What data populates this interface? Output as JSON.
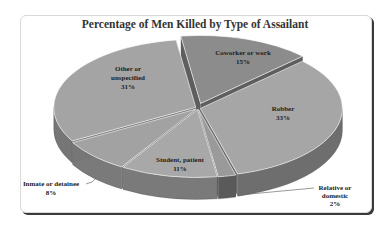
{
  "chart_data": {
    "type": "pie",
    "title": "Percentage of Men Killed by Type of Assailant",
    "style": "3d-exploded",
    "slices": [
      {
        "label": "Coworker or work",
        "value": 15,
        "display": "15%",
        "color": "#8c8c8c",
        "side": "#5e5e5e",
        "exploded": true
      },
      {
        "label": "Robber",
        "value": 33,
        "display": "33%",
        "color": "#a6a6a6",
        "side": "#6e6e6e",
        "exploded": false
      },
      {
        "label": "Relative or domestic",
        "value": 2,
        "display": "2%",
        "color": "#9a9a9a",
        "side": "#5a5a5a",
        "exploded": false
      },
      {
        "label": "Student, patient",
        "value": 11,
        "display": "11%",
        "color": "#a8a8a8",
        "side": "#7a7a7a",
        "exploded": false
      },
      {
        "label": "Inmate or detainee",
        "value": 8,
        "display": "8%",
        "color": "#a2a2a2",
        "side": "#7a7a7a",
        "exploded": false
      },
      {
        "label": "Other or unspecified",
        "value": 31,
        "display": "31%",
        "color": "#a4a4a4",
        "side": "#767676",
        "exploded": false
      }
    ],
    "legend": "none (labels on slices)"
  },
  "labels": {
    "coworker": [
      "Coworker or work",
      "15%"
    ],
    "robber": [
      "Robber",
      "33%"
    ],
    "relative": [
      "Relative or",
      "domestic",
      "2%"
    ],
    "student": [
      "Student, patient",
      "11%"
    ],
    "inmate": [
      "Inmate or detainee",
      "8%"
    ],
    "other": [
      "Other or",
      "unspecified",
      "31%"
    ]
  }
}
